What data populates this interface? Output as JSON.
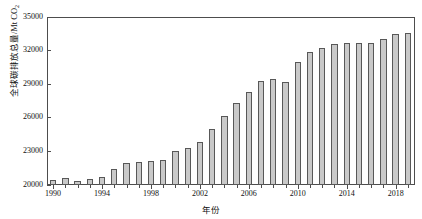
{
  "chart_data": {
    "type": "bar",
    "title": "",
    "xlabel": "年份",
    "ylabel": "全球碳排放总量/Mt CO₂",
    "ylabel_main": "全球碳排放总量/Mt CO",
    "ylabel_sub": "2",
    "ylim": [
      20000,
      35000
    ],
    "ytick_values": [
      20000,
      23000,
      26000,
      29000,
      32000,
      35000
    ],
    "ytick_labels": [
      "20000",
      "23000",
      "26000",
      "29000",
      "32000",
      "35000"
    ],
    "xtick_values": [
      1990,
      1994,
      1998,
      2002,
      2006,
      2010,
      2014,
      2018
    ],
    "xtick_labels": [
      "1990",
      "1994",
      "1998",
      "2002",
      "2006",
      "2010",
      "2014",
      "2018"
    ],
    "grid": false,
    "legend": "none",
    "categories": [
      1990,
      1991,
      1992,
      1993,
      1994,
      1995,
      1996,
      1997,
      1998,
      1999,
      2000,
      2001,
      2002,
      2003,
      2004,
      2005,
      2006,
      2007,
      2008,
      2009,
      2010,
      2011,
      2012,
      2013,
      2014,
      2015,
      2016,
      2017,
      2018,
      2019
    ],
    "values": [
      20450,
      20600,
      20400,
      20550,
      20700,
      21400,
      22000,
      22050,
      22100,
      22250,
      23000,
      23300,
      23800,
      25000,
      26200,
      27300,
      28300,
      29300,
      29500,
      29200,
      31000,
      31900,
      32200,
      32600,
      32700,
      32700,
      32700,
      33000,
      33500,
      33550
    ],
    "series_name": "全球碳排放总量",
    "bar_fill_color": "#c9c9c9",
    "bar_edge_color": "#585858",
    "axis_color": "#4d4d4d",
    "background_color": "#ffffff"
  }
}
